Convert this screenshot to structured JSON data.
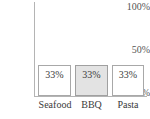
{
  "chart_data": {
    "type": "bar",
    "title": "",
    "subtitle": "",
    "xlabel": "",
    "ylabel": "",
    "categories": [
      "Seafood",
      "BBQ",
      "Pasta"
    ],
    "values": [
      33,
      33,
      33
    ],
    "value_labels": [
      "33%",
      "33%",
      "33%"
    ],
    "ylim": [
      0,
      100
    ],
    "yticks": [
      0,
      50,
      100
    ],
    "ytick_labels": [
      "0%",
      "50%",
      "100%"
    ],
    "grid": false,
    "legend": "none",
    "highlighted_category": "BBQ",
    "colors": {
      "bar_fill": "#ffffff",
      "bar_fill_highlight": "#e3e3e3",
      "bar_border": "#a8a8a8",
      "axis": "#b4b4b4",
      "text": "#3a3a3a",
      "tick_text": "#555555",
      "background": "#ffffff"
    }
  }
}
